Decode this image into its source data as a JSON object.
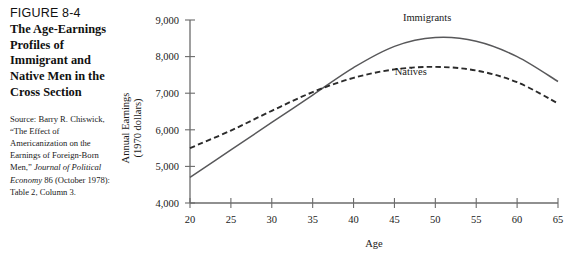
{
  "figure": {
    "number": "FIGURE 8-4",
    "title": "The Age-Earnings Profiles of Immigrant and Native Men in the Cross Section",
    "source_prefix": "Source: Barry R. Chiswick, “The Effect of Americanization on the Earnings of Foreign-Born Men,” ",
    "source_italic": "Journal of Political Economy",
    "source_suffix": " 86 (October 1978): Table 2, Column 3."
  },
  "chart_data": {
    "type": "line",
    "title": "",
    "xlabel": "Age",
    "ylabel": "Annual Earnings (1970 dollars)",
    "ylabel_line1": "Annual Earnings",
    "ylabel_line2": "(1970 dollars)",
    "xlim": [
      20,
      65
    ],
    "ylim": [
      4000,
      9000
    ],
    "xticks": [
      20,
      25,
      30,
      35,
      40,
      45,
      50,
      55,
      60,
      65
    ],
    "xtick_labels": [
      "20",
      "25",
      "30",
      "35",
      "40",
      "45",
      "50",
      "55",
      "60",
      "65"
    ],
    "yticks": [
      4000,
      5000,
      6000,
      7000,
      8000,
      9000
    ],
    "ytick_labels": [
      "4,000",
      "5,000",
      "6,000",
      "7,000",
      "8,000",
      "9,000"
    ],
    "grid": false,
    "legend_position": "inline-annotations",
    "series": [
      {
        "name": "Immigrants",
        "style": "solid",
        "color": "#58585a",
        "label_x": 49,
        "label_y": 8960,
        "x": [
          20,
          25,
          30,
          35,
          40,
          45,
          50,
          55,
          60,
          65
        ],
        "values": [
          4700,
          5450,
          6200,
          6950,
          7700,
          8280,
          8520,
          8420,
          8000,
          7320
        ]
      },
      {
        "name": "Natives",
        "style": "dashed",
        "color": "#2b2b2b",
        "label_x": 47,
        "label_y": 7500,
        "x": [
          20,
          25,
          30,
          35,
          40,
          45,
          50,
          55,
          60,
          65
        ],
        "values": [
          5500,
          5980,
          6520,
          7030,
          7420,
          7650,
          7720,
          7620,
          7300,
          6720
        ]
      }
    ],
    "annotations": [
      {
        "text": "Immigrants",
        "x": 49,
        "y": 8960
      },
      {
        "text": "Natives",
        "x": 47,
        "y": 7500
      }
    ]
  }
}
